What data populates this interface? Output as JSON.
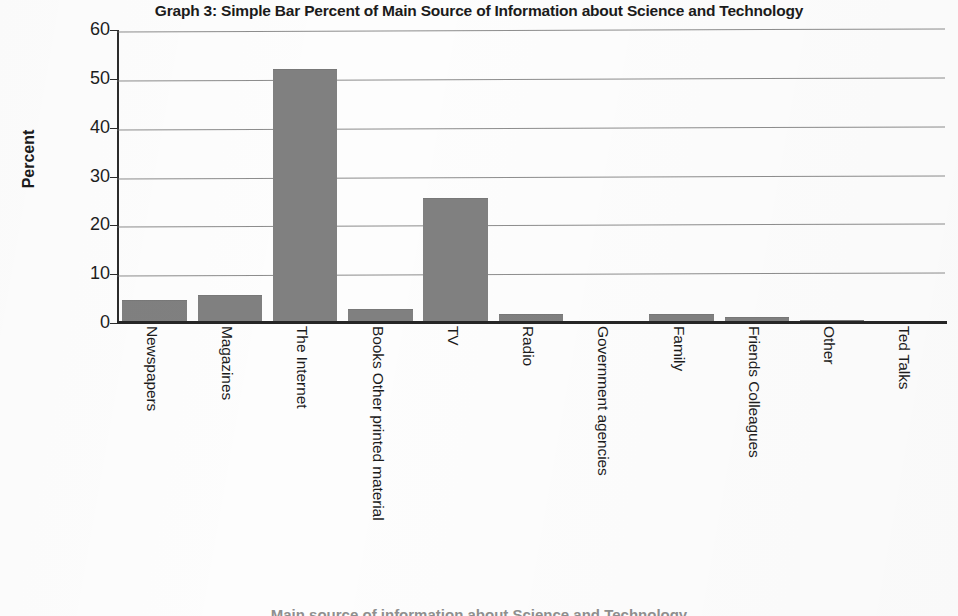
{
  "chart_data": {
    "type": "bar",
    "title": "Graph 3: Simple Bar Percent of Main Source of Information about Science and Technology",
    "xlabel": "Main source of information about Science and Technology",
    "ylabel": "Percent",
    "ylim": [
      0,
      60
    ],
    "ytick_labels": [
      "60",
      "50",
      "40",
      "30",
      "20",
      "10",
      "0"
    ],
    "ytick_values": [
      60,
      50,
      40,
      30,
      20,
      10,
      0
    ],
    "grid": true,
    "legend": "none",
    "bar_color": "#808080",
    "categories": [
      "Newspapers",
      "Magazines",
      "The Internet",
      "Books Other printed material",
      "TV",
      "Radio",
      "Government agencies",
      "Family",
      "Friends Colleagues",
      "Other",
      "Ted Talks"
    ],
    "values": [
      4.7,
      5.8,
      52.0,
      2.8,
      25.7,
      1.9,
      0.2,
      1.8,
      1.2,
      0.6,
      0.1
    ]
  },
  "axes": {
    "y_title": "Percent",
    "x_title_partial": "Main source of information about Science and Technology"
  }
}
